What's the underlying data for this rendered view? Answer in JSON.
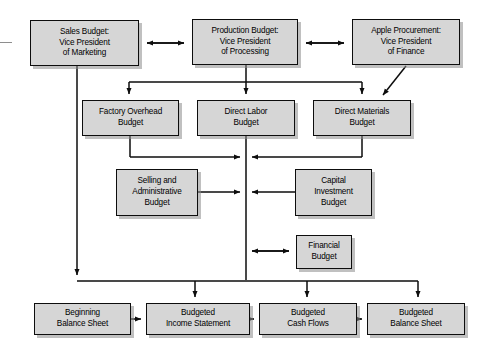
{
  "diagram": {
    "style": {
      "node_fill": "#d6d6d6",
      "node_border": "#0d0d0d",
      "line_color": "#0d0d0d",
      "background": "#ffffff",
      "shadow": "#8c8c8c"
    },
    "nodes": [
      {
        "id": "sales-budget",
        "name": "node-sales-budget",
        "text": "Sales Budget:\nVice President\nof Marketing",
        "x": 30,
        "y": 20,
        "w": 109,
        "h": 46
      },
      {
        "id": "production-budget",
        "name": "node-production-budget",
        "text": "Production Budget:\nVice President\nof Processing",
        "x": 192,
        "y": 19,
        "w": 106,
        "h": 46
      },
      {
        "id": "apple-procurement",
        "name": "node-apple-procurement",
        "text": "Apple Procurement:\nVice President\nof Finance",
        "x": 352,
        "y": 19,
        "w": 108,
        "h": 46
      },
      {
        "id": "factory-overhead",
        "name": "node-factory-overhead-budget",
        "text": "Factory Overhead\nBudget",
        "x": 82,
        "y": 100,
        "w": 97,
        "h": 36
      },
      {
        "id": "direct-labor",
        "name": "node-direct-labor-budget",
        "text": "Direct Labor\nBudget",
        "x": 197,
        "y": 100,
        "w": 98,
        "h": 36
      },
      {
        "id": "direct-materials",
        "name": "node-direct-materials-budget",
        "text": "Direct Materials\nBudget",
        "x": 313,
        "y": 100,
        "w": 98,
        "h": 36
      },
      {
        "id": "selling-admin",
        "name": "node-selling-and-administrative-budget",
        "text": "Selling and\nAdministrative\nBudget",
        "x": 116,
        "y": 169,
        "w": 82,
        "h": 47
      },
      {
        "id": "capital-investment",
        "name": "node-capital-investment-budget",
        "text": "Capital\nInvestment\nBudget",
        "x": 295,
        "y": 169,
        "w": 77,
        "h": 47
      },
      {
        "id": "financial-budget",
        "name": "node-financial-budget",
        "text": "Financial\nBudget",
        "x": 296,
        "y": 235,
        "w": 56,
        "h": 34
      },
      {
        "id": "beginning-balance-sheet",
        "name": "node-beginning-balance-sheet",
        "text": "Beginning\nBalance Sheet",
        "x": 34,
        "y": 303,
        "w": 97,
        "h": 32
      },
      {
        "id": "budgeted-income-statement",
        "name": "node-budgeted-income-statement",
        "text": "Budgeted\nIncome Statement",
        "x": 146,
        "y": 303,
        "w": 104,
        "h": 32
      },
      {
        "id": "budgeted-cash-flows",
        "name": "node-budgeted-cash-flows",
        "text": "Budgeted\nCash Flows",
        "x": 259,
        "y": 303,
        "w": 98,
        "h": 32
      },
      {
        "id": "budgeted-balance-sheet",
        "name": "node-budgeted-balance-sheet",
        "text": "Budgeted\nBalance Sheet",
        "x": 367,
        "y": 303,
        "w": 98,
        "h": 32
      }
    ],
    "edges": [
      {
        "id": "sales-production",
        "name": "edge-sales-to-production",
        "kind": "bidirectional-horizontal"
      },
      {
        "id": "production-apple",
        "name": "edge-production-to-apple-procurement",
        "kind": "bidirectional-horizontal"
      },
      {
        "id": "production-fanout",
        "name": "edge-production-to-manufacturing-budgets",
        "kind": "fanout-down"
      },
      {
        "id": "apple-materials",
        "name": "edge-apple-procurement-to-direct-materials",
        "kind": "diagonal"
      },
      {
        "id": "overhead-bus",
        "name": "edge-factory-overhead-to-bus",
        "kind": "elbow-right"
      },
      {
        "id": "materials-bus",
        "name": "edge-direct-materials-to-bus",
        "kind": "elbow-left"
      },
      {
        "id": "labor-bus",
        "name": "edge-direct-labor-to-bus",
        "kind": "vertical"
      },
      {
        "id": "selling-bus",
        "name": "edge-selling-admin-to-bus",
        "kind": "horizontal-right"
      },
      {
        "id": "capital-bus",
        "name": "edge-capital-investment-to-bus",
        "kind": "horizontal-left"
      },
      {
        "id": "financial-bus",
        "name": "edge-bus-to-financial-budget",
        "kind": "bidirectional-horizontal"
      },
      {
        "id": "sales-bottom",
        "name": "edge-sales-budget-to-bottom-bus",
        "kind": "elbow-down-right"
      },
      {
        "id": "bus-bottom",
        "name": "edge-bus-to-bottom-statements",
        "kind": "fanout-down"
      },
      {
        "id": "beg-to-income",
        "name": "edge-beginning-balance-to-income-statement",
        "kind": "horizontal-right"
      },
      {
        "id": "income-to-cash",
        "name": "edge-income-statement-to-cash-flows",
        "kind": "horizontal-right"
      },
      {
        "id": "cash-to-balance",
        "name": "edge-cash-flows-to-budgeted-balance-sheet",
        "kind": "horizontal-right"
      }
    ]
  }
}
